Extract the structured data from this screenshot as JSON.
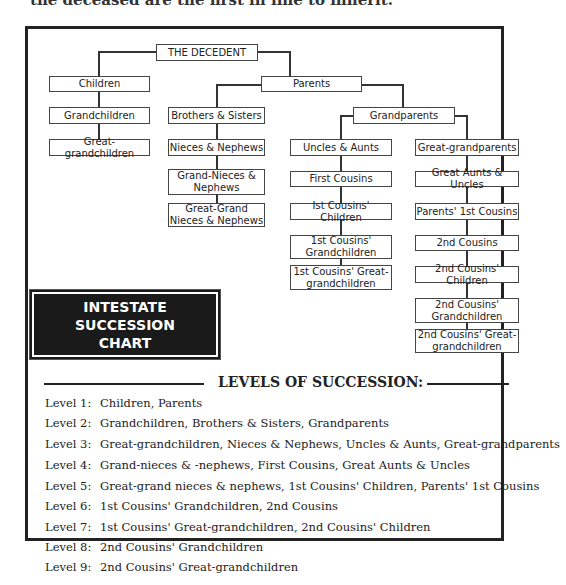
{
  "header_fragment": "the deceased are the first in line to inherit.",
  "chart_title": [
    "INTESTATE",
    "SUCCESSION",
    "CHART"
  ],
  "nodes": {
    "decedent": "THE DECEDENT",
    "children": "Children",
    "grandchildren": "Grandchildren",
    "great_grandchildren": "Great-grandchildren",
    "parents": "Parents",
    "brothers_sisters": "Brothers & Sisters",
    "nieces_nephews": "Nieces & Nephews",
    "grand_nieces_nephews": "Grand-Nieces & Nephews",
    "great_grand_nieces_nephews": "Great-Grand Nieces & Nephews",
    "grandparents": "Grandparents",
    "uncles_aunts": "Uncles & Aunts",
    "first_cousins": "First Cousins",
    "first_cousins_children": "Ist Cousins' Children",
    "first_cousins_grandchildren": "1st Cousins' Grandchildren",
    "first_cousins_great_grandchildren": "1st Cousins' Great-grandchildren",
    "great_grandparents": "Great-grandparents",
    "great_aunts_uncles": "Great Aunts & Uncles",
    "parents_first_cousins": "Parents' 1st Cousins",
    "second_cousins": "2nd Cousins",
    "second_cousins_children": "2nd Cousins' Children",
    "second_cousins_grandchildren": "2nd Cousins' Grandchildren",
    "second_cousins_great_grandchildren": "2nd Cousins' Great-grandchildren"
  },
  "levels": {
    "heading": "LEVELS OF SUCCESSION:",
    "rows": [
      {
        "label": "Level 1:",
        "text": "Children, Parents"
      },
      {
        "label": "Level 2:",
        "text": "Grandchildren, Brothers & Sisters, Grandparents"
      },
      {
        "label": "Level 3:",
        "text": "Great-grandchildren, Nieces & Nephews, Uncles & Aunts, Great-grandparents"
      },
      {
        "label": "Level 4:",
        "text": "Grand-nieces & -nephews, First Cousins, Great Aunts & Uncles"
      },
      {
        "label": "Level 5:",
        "text": "Great-grand nieces & nephews, 1st Cousins' Children, Parents' 1st Cousins"
      },
      {
        "label": "Level 6:",
        "text": "1st Cousins' Grandchildren, 2nd Cousins"
      },
      {
        "label": "Level 7:",
        "text": "1st Cousins' Great-grandchildren, 2nd Cousins' Children"
      },
      {
        "label": "Level 8:",
        "text": "2nd Cousins' Grandchildren"
      },
      {
        "label": "Level 9:",
        "text": "2nd Cousins' Great-grandchildren"
      }
    ]
  }
}
